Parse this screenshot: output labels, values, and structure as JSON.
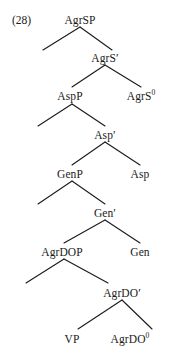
{
  "figure": {
    "example_number": "(28)",
    "type": "syntax-tree",
    "line_color": "#1a1a1a",
    "text_color": "#1a1a1a",
    "background_color": "#ffffff"
  },
  "nodes": [
    {
      "id": "agrsp",
      "text": "AgrSP",
      "sup": "",
      "x": 80,
      "y": 14
    },
    {
      "id": "agrs-bar",
      "text": "AgrS",
      "sup": "",
      "prime": true,
      "x": 105,
      "y": 52
    },
    {
      "id": "aspp",
      "text": "AspP",
      "sup": "",
      "x": 70,
      "y": 90
    },
    {
      "id": "agrs0",
      "text": "AgrS",
      "sup": "0",
      "x": 141,
      "y": 90
    },
    {
      "id": "asp-bar",
      "text": "Asp",
      "sup": "",
      "prime": true,
      "x": 105,
      "y": 129
    },
    {
      "id": "genp",
      "text": "GenP",
      "sup": "",
      "x": 70,
      "y": 168
    },
    {
      "id": "asp",
      "text": "Asp",
      "sup": "",
      "x": 140,
      "y": 168
    },
    {
      "id": "gen-bar",
      "text": "Gen",
      "sup": "",
      "prime": true,
      "x": 105,
      "y": 207
    },
    {
      "id": "agrdop",
      "text": "AgrDOP",
      "sup": "",
      "x": 62,
      "y": 246
    },
    {
      "id": "gen",
      "text": "Gen",
      "sup": "",
      "x": 140,
      "y": 246
    },
    {
      "id": "agrdo-bar",
      "text": "AgrDO",
      "sup": "",
      "prime": true,
      "x": 122,
      "y": 287
    },
    {
      "id": "vp",
      "text": "VP",
      "sup": "",
      "x": 72,
      "y": 333
    },
    {
      "id": "agrdo0",
      "text": "AgrDO",
      "sup": "0",
      "x": 130,
      "y": 333
    }
  ],
  "branches": [
    {
      "id": "b1",
      "parent": "agrsp",
      "apex_x": 80,
      "apex_y": 27,
      "left_x": 43,
      "left_y": 50,
      "right_x": 112,
      "right_y": 50
    },
    {
      "id": "b2",
      "parent": "agrs-bar",
      "apex_x": 105,
      "apex_y": 65,
      "left_x": 72,
      "left_y": 87,
      "right_x": 141,
      "right_y": 87
    },
    {
      "id": "b3",
      "parent": "aspp",
      "apex_x": 72,
      "apex_y": 104,
      "left_x": 38,
      "left_y": 126,
      "right_x": 105,
      "right_y": 126
    },
    {
      "id": "b4",
      "parent": "asp-bar",
      "apex_x": 105,
      "apex_y": 142,
      "left_x": 72,
      "left_y": 165,
      "right_x": 140,
      "right_y": 165
    },
    {
      "id": "b5",
      "parent": "genp",
      "apex_x": 72,
      "apex_y": 181,
      "left_x": 38,
      "left_y": 204,
      "right_x": 105,
      "right_y": 204
    },
    {
      "id": "b6",
      "parent": "gen-bar",
      "apex_x": 105,
      "apex_y": 220,
      "left_x": 64,
      "left_y": 243,
      "right_x": 140,
      "right_y": 243
    },
    {
      "id": "b7",
      "parent": "agrdop",
      "apex_x": 64,
      "apex_y": 259,
      "left_x": 26,
      "left_y": 283,
      "right_x": 108,
      "right_y": 283
    },
    {
      "id": "b8",
      "parent": "agrdo-bar",
      "apex_x": 122,
      "apex_y": 300,
      "left_x": 78,
      "left_y": 329,
      "right_x": 152,
      "right_y": 329
    }
  ],
  "example_label": {
    "text": "(28)",
    "x": 12,
    "y": 14
  }
}
